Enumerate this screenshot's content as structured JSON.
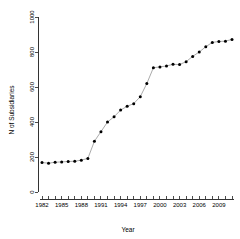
{
  "chart_data": {
    "type": "scatter",
    "title": "",
    "xlabel": "Year",
    "ylabel": "N of Subsidiaries",
    "xlim": [
      1981,
      2011
    ],
    "ylim": [
      0,
      1000
    ],
    "grid": false,
    "legend": null,
    "marker": "filled-circle",
    "connected": true,
    "x_tick_labels": [
      "1982",
      "1985",
      "1988",
      "1991",
      "1994",
      "1997",
      "2000",
      "2003",
      "2006",
      "2009"
    ],
    "x_tick_values": [
      1982,
      1985,
      1988,
      1991,
      1994,
      1997,
      2000,
      2003,
      2006,
      2009
    ],
    "x_minor_ticks": [
      1982,
      1983,
      1984,
      1985,
      1986,
      1987,
      1988,
      1989,
      1990,
      1991,
      1992,
      1993,
      1994,
      1995,
      1996,
      1997,
      1998,
      1999,
      2000,
      2001,
      2002,
      2003,
      2004,
      2005,
      2006,
      2007,
      2008,
      2009,
      2010,
      2011
    ],
    "y_tick_labels": [
      "0",
      "200",
      "400",
      "600",
      "800",
      "1000"
    ],
    "y_tick_values": [
      0,
      200,
      400,
      600,
      800,
      1000
    ],
    "x": [
      1982,
      1983,
      1984,
      1985,
      1986,
      1987,
      1988,
      1989,
      1990,
      1991,
      1992,
      1993,
      1994,
      1995,
      1996,
      1997,
      1998,
      1999,
      2000,
      2001,
      2002,
      2003,
      2004,
      2005,
      2006,
      2007,
      2008,
      2009,
      2010,
      2011
    ],
    "values": [
      168,
      165,
      170,
      172,
      174,
      176,
      182,
      192,
      290,
      345,
      400,
      430,
      468,
      490,
      505,
      545,
      620,
      710,
      715,
      720,
      730,
      728,
      745,
      775,
      800,
      830,
      855,
      860,
      862,
      872
    ],
    "points": [
      {
        "year": 1982,
        "value": 168
      },
      {
        "year": 1983,
        "value": 165
      },
      {
        "year": 1984,
        "value": 170
      },
      {
        "year": 1985,
        "value": 172
      },
      {
        "year": 1986,
        "value": 174
      },
      {
        "year": 1987,
        "value": 176
      },
      {
        "year": 1988,
        "value": 182
      },
      {
        "year": 1989,
        "value": 192
      },
      {
        "year": 1990,
        "value": 290
      },
      {
        "year": 1991,
        "value": 345
      },
      {
        "year": 1992,
        "value": 400
      },
      {
        "year": 1993,
        "value": 430
      },
      {
        "year": 1994,
        "value": 468
      },
      {
        "year": 1995,
        "value": 490
      },
      {
        "year": 1996,
        "value": 505
      },
      {
        "year": 1997,
        "value": 545
      },
      {
        "year": 1998,
        "value": 620
      },
      {
        "year": 1999,
        "value": 710
      },
      {
        "year": 2000,
        "value": 715
      },
      {
        "year": 2001,
        "value": 720
      },
      {
        "year": 2002,
        "value": 730
      },
      {
        "year": 2003,
        "value": 728
      },
      {
        "year": 2004,
        "value": 745
      },
      {
        "year": 2005,
        "value": 775
      },
      {
        "year": 2006,
        "value": 800
      },
      {
        "year": 2007,
        "value": 830
      },
      {
        "year": 2008,
        "value": 855
      },
      {
        "year": 2009,
        "value": 860
      },
      {
        "year": 2010,
        "value": 862
      },
      {
        "year": 2011,
        "value": 872
      }
    ]
  },
  "colors": {
    "point": "#000000",
    "line": "#555555",
    "axis": "#000000",
    "background": "#ffffff"
  }
}
